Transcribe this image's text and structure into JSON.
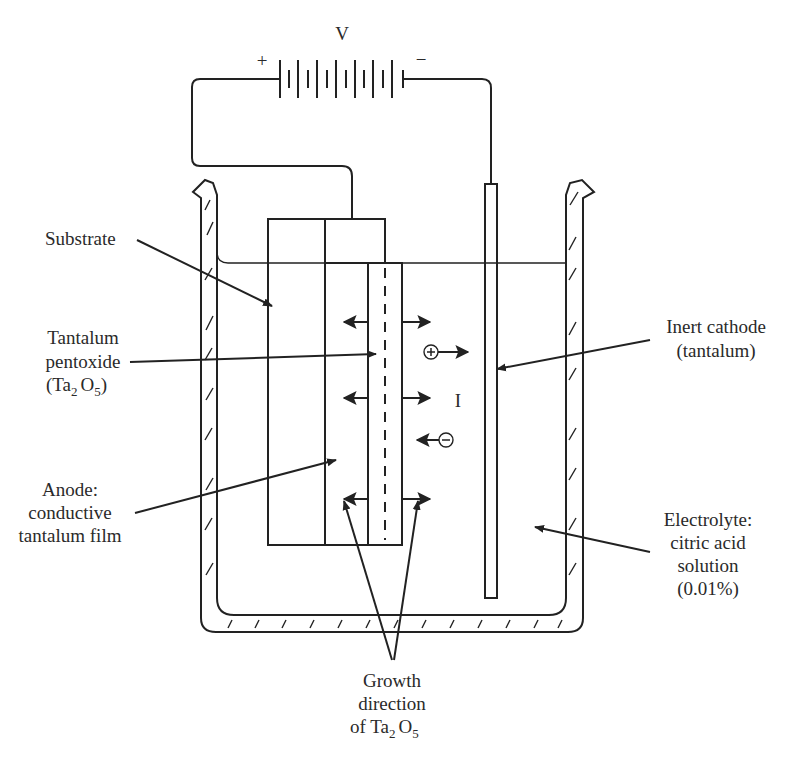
{
  "figure": {
    "battery": {
      "label": "V",
      "positive": "+",
      "negative": "−"
    },
    "current_label": "I",
    "ions": {
      "positive": "+",
      "negative": "−"
    },
    "labels": {
      "substrate": [
        "Substrate"
      ],
      "oxide": [
        "Tantalum",
        "pentoxide",
        "(Ta",
        "2",
        "O",
        "5",
        ")"
      ],
      "anode": [
        "Anode:",
        "conductive",
        "tantalum film"
      ],
      "cathode": [
        "Inert cathode",
        "(tantalum)"
      ],
      "electrolyte": [
        "Electrolyte:",
        "citric acid",
        "solution",
        "(0.01%)"
      ],
      "growth": [
        "Growth",
        "direction",
        "of Ta",
        "2",
        "O",
        "5"
      ]
    },
    "colors": {
      "ink": "#222222",
      "background": "#ffffff"
    }
  }
}
